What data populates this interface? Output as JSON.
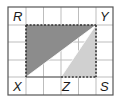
{
  "diagram": {
    "grid": {
      "cols": 6,
      "rows": 5,
      "line_color": "#b9b9b9",
      "border_color": "#444444"
    },
    "labels": {
      "R": "R",
      "Y": "Y",
      "X": "X",
      "Z": "Z",
      "S": "S"
    },
    "rectangle": {
      "corners": [
        "R",
        "Y",
        "S",
        "X"
      ],
      "style": "dashed"
    },
    "shaded_regions": [
      {
        "name": "triangle-RYX",
        "vertices": [
          "R",
          "Y",
          "X"
        ],
        "color": "#8c8c8c"
      },
      {
        "name": "triangle-YZS",
        "vertices": [
          "Y",
          "Z",
          "S"
        ],
        "color": "#d0d0d0"
      }
    ]
  }
}
